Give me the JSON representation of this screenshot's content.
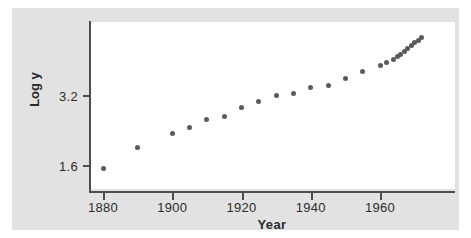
{
  "figure": {
    "background_color": "#e2e2e2",
    "plot_background_color": "#ffffff",
    "axis_color": "#4c4c4c",
    "point_color": "#5a5a5a"
  },
  "chart_data": {
    "type": "scatter",
    "title": "",
    "xlabel": "Year",
    "ylabel": "Log y",
    "xlim": [
      1876,
      1977
    ],
    "ylim": [
      1.35,
      5.2
    ],
    "xticks": [
      1880,
      1900,
      1920,
      1940,
      1960
    ],
    "xticklabels": [
      "1880",
      "1900",
      "1920",
      "1940",
      "1960"
    ],
    "yticks": [
      1.6,
      3.2
    ],
    "yticklabels": [
      "1.6",
      "3.2"
    ],
    "grid": false,
    "legend": false,
    "marker": "circle",
    "x": [
      1880,
      1890,
      1900,
      1905,
      1910,
      1915,
      1920,
      1925,
      1930,
      1935,
      1940,
      1945,
      1950,
      1955,
      1960,
      1962,
      1964,
      1965,
      1966,
      1967,
      1968,
      1969,
      1970,
      1971,
      1972
    ],
    "y": [
      1.52,
      1.99,
      2.31,
      2.46,
      2.63,
      2.72,
      2.91,
      3.06,
      3.2,
      3.24,
      3.37,
      3.42,
      3.57,
      3.73,
      3.88,
      3.95,
      4.01,
      4.08,
      4.13,
      4.2,
      4.26,
      4.33,
      4.39,
      4.45,
      4.52
    ]
  }
}
